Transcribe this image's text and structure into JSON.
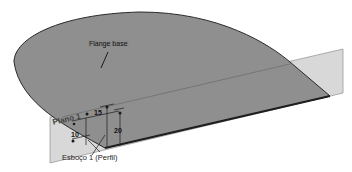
{
  "diagram": {
    "type": "cad-sheet-metal-feature",
    "labels": {
      "feature": "Flange base",
      "plane": "Plano 1",
      "sketch": "Esboço 1 (Perfil)"
    },
    "dimensions": {
      "d1": "15",
      "d2": "10",
      "d3": "20"
    },
    "colors": {
      "flange_face": "#8f8f8f",
      "flange_edge": "#2a2a2a",
      "plane_fill": "#d6d6d6",
      "plane_edge": "#9a9a9a",
      "background": "#ffffff"
    }
  }
}
